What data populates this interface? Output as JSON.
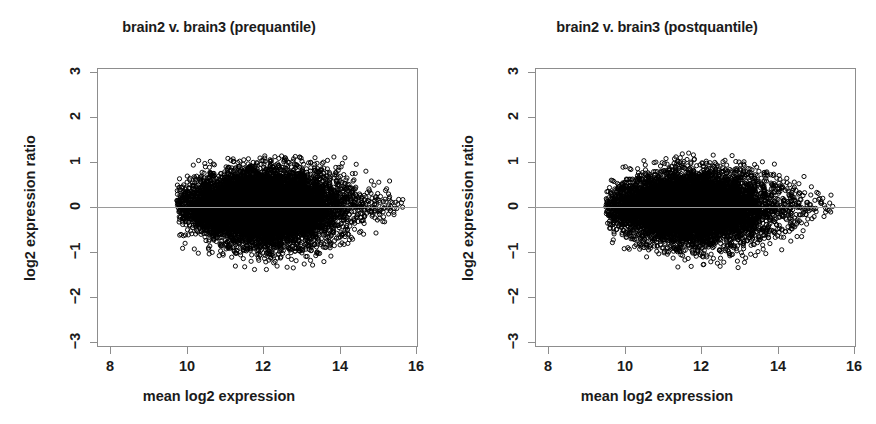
{
  "figure": {
    "width": 876,
    "height": 424,
    "background": "#ffffff",
    "foreground": "#1b1b1b",
    "axis_color": "#8d8d8d",
    "point_color": "#000000",
    "reference_line_color": "#9a9a9a"
  },
  "panels": [
    {
      "id": "prequantile",
      "title": "brain2 v. brain3 (prequantile)",
      "xlabel": "mean log2 expression",
      "ylabel": "log2 expression ratio"
    },
    {
      "id": "postquantile",
      "title": "brain2 v. brain3 (postquantile)",
      "xlabel": "mean log2 expression",
      "ylabel": "log2 expression ratio"
    }
  ],
  "chart_data": [
    {
      "type": "scatter",
      "title": "brain2 v. brain3 (prequantile)",
      "xlabel": "mean log2 expression",
      "ylabel": "log2 expression ratio",
      "xlim": [
        7.6,
        16.5
      ],
      "ylim": [
        -3.35,
        3.35
      ],
      "xticks": [
        8,
        10,
        12,
        14,
        16
      ],
      "yticks": [
        3,
        2,
        1,
        0,
        -1,
        -2,
        -3
      ],
      "xtick_labels": [
        "8",
        "10",
        "12",
        "14",
        "16"
      ],
      "ytick_labels": [
        "3",
        "2",
        "1",
        "0",
        "-1",
        "-2",
        "-3"
      ],
      "grid": false,
      "legend": null,
      "marker": "open-circle",
      "marker_size_px": 4.2,
      "n_points": 8800,
      "reference_line": {
        "orientation": "horizontal",
        "y": 0
      },
      "cloud": {
        "x_range": [
          9.75,
          15.75
        ],
        "y_range": [
          -1.4,
          1.15
        ],
        "x_mode": 11.9,
        "x_sd": 1.0,
        "y_center": 0.02,
        "y_spread_at_core": 0.42,
        "y_spread_at_tail": 0.22,
        "skew_low": -0.06,
        "seed": 20110
      },
      "description": "Dense MA-plot point cloud centred near log-ratio 0, widest between mean expression 10.5 and 13.5, tapering to sparse points out to ~15.8 with slight positive drift at the high-expression tail and a scatter of low outliers down to about -1.35."
    },
    {
      "type": "scatter",
      "title": "brain2 v. brain3 (postquantile)",
      "xlabel": "mean log2 expression",
      "ylabel": "log2 expression ratio",
      "xlim": [
        7.6,
        16.5
      ],
      "ylim": [
        -3.35,
        3.35
      ],
      "xticks": [
        8,
        10,
        12,
        14,
        16
      ],
      "yticks": [
        3,
        2,
        1,
        0,
        -1,
        -2,
        -3
      ],
      "xtick_labels": [
        "8",
        "10",
        "12",
        "14",
        "16"
      ],
      "ytick_labels": [
        "3",
        "2",
        "1",
        "0",
        "-1",
        "-2",
        "-3"
      ],
      "grid": false,
      "legend": null,
      "marker": "open-circle",
      "marker_size_px": 4.2,
      "n_points": 8800,
      "reference_line": {
        "orientation": "horizontal",
        "y": 0
      },
      "cloud": {
        "x_range": [
          9.5,
          15.5
        ],
        "y_range": [
          -1.35,
          1.2
        ],
        "x_mode": 11.6,
        "x_sd": 0.98,
        "y_center": 0.0,
        "y_spread_at_core": 0.4,
        "y_spread_at_tail": 0.2,
        "skew_low": -0.03,
        "seed": 77013
      },
      "description": "Quantile-normalised MA plot: same dense cloud tightly centred on log-ratio 0, slightly more symmetric and shifted marginally left, with sparse high-expression points reaching about 15.5 and low outliers near -1.3."
    }
  ]
}
